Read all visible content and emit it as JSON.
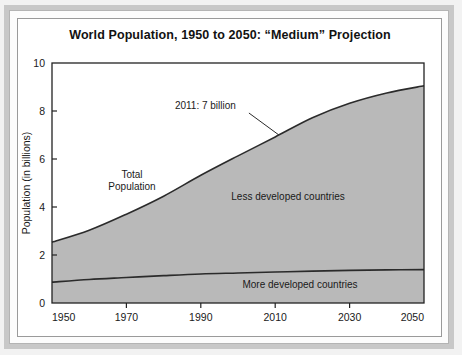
{
  "chart_data": {
    "type": "area",
    "title": "World Population, 1950 to 2050: “Medium” Projection",
    "xlabel": "",
    "ylabel": "Population (in billions)",
    "xlim": [
      1950,
      2050
    ],
    "ylim": [
      0,
      10
    ],
    "xticks": [
      1950,
      1970,
      1990,
      2010,
      2030,
      2050
    ],
    "yticks": [
      0,
      2,
      4,
      6,
      8,
      10
    ],
    "xtick_labels": [
      "1950",
      "1970",
      "1990",
      "2010",
      "2030",
      "2050"
    ],
    "ytick_labels": [
      "0",
      "2",
      "4",
      "6",
      "8",
      "10"
    ],
    "grid": false,
    "legend": "in-plot labels",
    "x": [
      1950,
      1960,
      1970,
      1980,
      1990,
      2000,
      2010,
      2020,
      2030,
      2040,
      2050
    ],
    "series": [
      {
        "name": "Total Population",
        "label": "Total Population",
        "values": [
          2.53,
          3.03,
          3.7,
          4.45,
          5.32,
          6.13,
          6.92,
          7.72,
          8.32,
          8.75,
          9.05
        ]
      },
      {
        "name": "More developed countries",
        "label": "More developed countries",
        "values": [
          0.87,
          0.98,
          1.06,
          1.14,
          1.21,
          1.25,
          1.29,
          1.33,
          1.36,
          1.38,
          1.39
        ]
      }
    ],
    "band_label": "Less developed countries",
    "annotations": [
      {
        "text": "2011: 7 billion",
        "x": 2011,
        "y": 7.0
      }
    ],
    "colors": {
      "band_fill": "#b9b9b9",
      "line": "#2b2b2b",
      "axis": "#222222",
      "plot_background": "#ffffff"
    }
  }
}
